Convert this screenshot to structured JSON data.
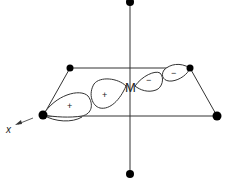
{
  "diagram": {
    "center_atom": "M",
    "axis_label": "x",
    "lobes": [
      {
        "sign": "+",
        "position": "ligand-orbital"
      },
      {
        "sign": "+",
        "position": "metal-d-lobe-left"
      },
      {
        "sign": "−",
        "position": "metal-d-lobe-right"
      },
      {
        "sign": "−",
        "position": "ligand-orbital-right"
      }
    ],
    "ligands": [
      "top",
      "bottom",
      "back-left",
      "back-right",
      "front-left",
      "front-right"
    ],
    "colors": {
      "line": "#333333",
      "atom": "#000000",
      "background": "#ffffff"
    }
  }
}
